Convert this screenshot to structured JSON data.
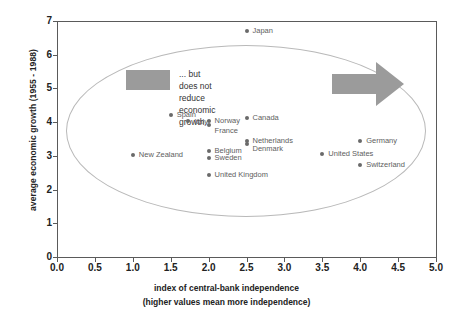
{
  "chart_data": {
    "type": "scatter",
    "title": "",
    "xlabel": "index of central-bank independence",
    "xlabel_sub": "(higher values mean more independence)",
    "ylabel": "average economic growth (1955 - 1988)",
    "xlim": [
      0.0,
      5.0
    ],
    "ylim": [
      0,
      7
    ],
    "xticks": [
      "0.0",
      "0.5",
      "1.0",
      "1.5",
      "2.0",
      "2.5",
      "3.0",
      "3.5",
      "4.0",
      "4.5",
      "5.0"
    ],
    "yticks": [
      "0",
      "1",
      "2",
      "3",
      "4",
      "5",
      "6",
      "7"
    ],
    "grid": false,
    "legend": "none",
    "marker_color": "#6a6a6a",
    "accent_gray": "#9b9b9b",
    "points": [
      {
        "label": "Japan",
        "x": 2.5,
        "y": 6.7,
        "label_dx": 6,
        "label_dy": 0
      },
      {
        "label": "Spain",
        "x": 1.5,
        "y": 4.22,
        "label_dx": 6,
        "label_dy": 0
      },
      {
        "label": "Italy",
        "x": 1.73,
        "y": 4.03,
        "label_dx": 6,
        "label_dy": 1
      },
      {
        "label": "Norway",
        "x": 2.0,
        "y": 4.03,
        "label_dx": 6,
        "label_dy": 0
      },
      {
        "label": "France",
        "x": 2.0,
        "y": 3.92,
        "label_dx": 6,
        "label_dy": 6
      },
      {
        "label": "Canada",
        "x": 2.5,
        "y": 4.12,
        "label_dx": 6,
        "label_dy": 0
      },
      {
        "label": "Netherlands",
        "x": 2.5,
        "y": 3.45,
        "label_dx": 6,
        "label_dy": 0
      },
      {
        "label": "Denmark",
        "x": 2.5,
        "y": 3.35,
        "label_dx": 6,
        "label_dy": 5
      },
      {
        "label": "Germany",
        "x": 4.0,
        "y": 3.45,
        "label_dx": 6,
        "label_dy": 0
      },
      {
        "label": "United States",
        "x": 3.5,
        "y": 3.05,
        "label_dx": 6,
        "label_dy": 0
      },
      {
        "label": "Switzerland",
        "x": 4.0,
        "y": 2.72,
        "label_dx": 6,
        "label_dy": 0
      },
      {
        "label": "New Zealand",
        "x": 1.0,
        "y": 3.03,
        "label_dx": 6,
        "label_dy": 0
      },
      {
        "label": "Belgium",
        "x": 2.0,
        "y": 3.15,
        "label_dx": 6,
        "label_dy": 0
      },
      {
        "label": "Sweden",
        "x": 2.0,
        "y": 2.93,
        "label_dx": 6,
        "label_dy": 0
      },
      {
        "label": "United Kingdom",
        "x": 2.0,
        "y": 2.43,
        "label_dx": 6,
        "label_dy": 0
      }
    ],
    "annotations": [
      {
        "name": "callout",
        "text": "... but does not reduce\neconomic growth.",
        "kind": "text"
      }
    ]
  },
  "annotation": {
    "callout_text": "... but does not reduce\neconomic growth."
  }
}
